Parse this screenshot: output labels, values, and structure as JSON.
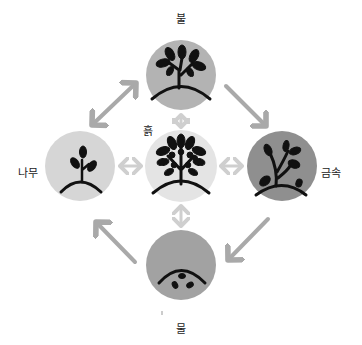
{
  "diagram": {
    "type": "five-elements-cycle",
    "nodes": [
      {
        "id": "fire",
        "label": "불",
        "icon": "tree-full-leaves-icon",
        "color": "#b3b3b3",
        "position": "top"
      },
      {
        "id": "earth",
        "label": "흙",
        "icon": "tree-with-fruit-icon",
        "color": "#e4e4e4",
        "position": "center"
      },
      {
        "id": "wood",
        "label": "나무",
        "icon": "sprout-icon",
        "color": "#d6d6d6",
        "position": "left"
      },
      {
        "id": "metal",
        "label": "금속",
        "icon": "bare-branch-tree-icon",
        "color": "#8f8f8f",
        "position": "right"
      },
      {
        "id": "water",
        "label": "물",
        "icon": "seed-under-ground-icon",
        "color": "#a2a2a2",
        "position": "bottom"
      }
    ],
    "edges": [
      {
        "from": "wood",
        "to": "fire",
        "style": "double-arrow"
      },
      {
        "from": "fire",
        "to": "metal",
        "style": "arrow"
      },
      {
        "from": "metal",
        "to": "water",
        "style": "arrow"
      },
      {
        "from": "water",
        "to": "wood",
        "style": "arrow"
      },
      {
        "from": "earth",
        "to": "fire",
        "style": "double-arrow"
      },
      {
        "from": "earth",
        "to": "wood",
        "style": "double-arrow"
      },
      {
        "from": "earth",
        "to": "metal",
        "style": "double-arrow"
      },
      {
        "from": "earth",
        "to": "water",
        "style": "double-arrow"
      }
    ],
    "colors": {
      "arrow_outer": "#a9a9a9",
      "arrow_inner": "#cfcfcf",
      "icon": "#111111"
    }
  }
}
